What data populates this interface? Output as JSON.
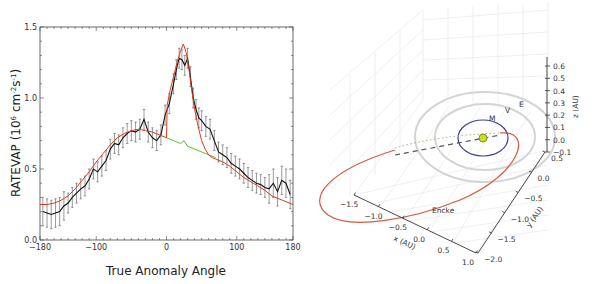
{
  "chart_data": [
    {
      "type": "line",
      "title": "",
      "xlabel": "True Anomaly Angle",
      "ylabel": "RATEVAP (10^6 cm^-2 s^-1)",
      "ylabel_parts": {
        "main": "RATEVAP (10",
        "sup1": "6",
        "mid": " cm",
        "sup2": "-2",
        "mid2": "s",
        "sup3": "-1",
        "end": ")"
      },
      "xlim": [
        -180,
        180
      ],
      "ylim": [
        0.0,
        1.5
      ],
      "xticks": [
        "-180",
        "-100",
        "0",
        "100",
        "180"
      ],
      "xtick_values": [
        -180,
        -100,
        0,
        100,
        180
      ],
      "yticks": [
        "0.0",
        "0.5",
        "1.0",
        "1.5"
      ],
      "ytick_values": [
        0.0,
        0.5,
        1.0,
        1.5
      ],
      "grid": false,
      "series": [
        {
          "name": "observed",
          "color": "#111111",
          "error_bars": true,
          "x": [
            -176,
            -170,
            -164,
            -158,
            -152,
            -146,
            -140,
            -134,
            -128,
            -122,
            -116,
            -110,
            -104,
            -98,
            -92,
            -86,
            -80,
            -74,
            -68,
            -62,
            -56,
            -50,
            -44,
            -38,
            -32,
            -26,
            -20,
            -14,
            -8,
            -2,
            4,
            10,
            14,
            18,
            22,
            26,
            30,
            34,
            38,
            42,
            46,
            50,
            56,
            62,
            68,
            74,
            80,
            86,
            92,
            98,
            104,
            110,
            116,
            122,
            128,
            134,
            140,
            146,
            152,
            158,
            164,
            170,
            176
          ],
          "y": [
            0.2,
            0.19,
            0.18,
            0.19,
            0.2,
            0.24,
            0.26,
            0.3,
            0.33,
            0.36,
            0.38,
            0.43,
            0.5,
            0.48,
            0.52,
            0.56,
            0.64,
            0.68,
            0.67,
            0.72,
            0.75,
            0.77,
            0.76,
            0.78,
            0.85,
            0.76,
            0.72,
            0.7,
            0.74,
            0.88,
            0.96,
            1.1,
            1.2,
            1.28,
            1.27,
            1.23,
            1.28,
            1.15,
            1.0,
            0.92,
            0.86,
            0.84,
            0.8,
            0.78,
            0.7,
            0.62,
            0.6,
            0.58,
            0.54,
            0.52,
            0.5,
            0.47,
            0.44,
            0.42,
            0.4,
            0.39,
            0.37,
            0.36,
            0.4,
            0.34,
            0.42,
            0.4,
            0.32
          ],
          "err": 0.07
        },
        {
          "name": "model",
          "color": "#e03a1e",
          "x": [
            -180,
            -170,
            -160,
            -150,
            -140,
            -130,
            -120,
            -110,
            -100,
            -90,
            -80,
            -70,
            -60,
            -50,
            -40,
            -30,
            -20,
            -10,
            0,
            1,
            5,
            10,
            15,
            20,
            24,
            28,
            32,
            36,
            40,
            45,
            50,
            55,
            60,
            65,
            70,
            80,
            90,
            100,
            110,
            120,
            130,
            140,
            150,
            160,
            170,
            180
          ],
          "y": [
            0.25,
            0.25,
            0.26,
            0.28,
            0.31,
            0.36,
            0.42,
            0.48,
            0.55,
            0.61,
            0.67,
            0.72,
            0.75,
            0.77,
            0.78,
            0.77,
            0.76,
            0.74,
            0.72,
            0.95,
            1.05,
            1.15,
            1.25,
            1.33,
            1.38,
            1.32,
            1.2,
            1.05,
            0.92,
            0.8,
            0.7,
            0.64,
            0.6,
            0.58,
            0.57,
            0.55,
            0.52,
            0.48,
            0.44,
            0.41,
            0.38,
            0.35,
            0.31,
            0.29,
            0.27,
            0.25
          ]
        },
        {
          "name": "baseline",
          "color": "#66bb33",
          "x": [
            0,
            10,
            20,
            25,
            30,
            40,
            50,
            60,
            70
          ],
          "y": [
            0.72,
            0.7,
            0.68,
            0.7,
            0.66,
            0.64,
            0.62,
            0.6,
            0.58
          ]
        }
      ]
    },
    {
      "type": "scatter",
      "subtype": "3d-orbit-plot",
      "title": "",
      "xlabel": "x (AU)",
      "ylabel": "y (AU)",
      "zlabel": "z (AU)",
      "xticks": [
        "-1.5",
        "-1.0",
        "-0.5",
        "0.0",
        "0.5",
        "1.0"
      ],
      "yticks": [
        "0.5",
        "0.0",
        "-0.5",
        "-1.0",
        "-1.5",
        "-2.0"
      ],
      "zticks": [
        "0.6",
        "0.5",
        "0.4",
        "0.3",
        "0.2",
        "0.1",
        "0.0",
        "-0.1"
      ],
      "xlim": [
        -1.5,
        1.0
      ],
      "ylim": [
        -2.0,
        0.5
      ],
      "zlim": [
        -0.1,
        0.6
      ],
      "grid": true,
      "orbits": [
        {
          "name": "Encke",
          "label": "Encke",
          "color": "#d9593c"
        },
        {
          "name": "Earth",
          "label": "E",
          "color": "#cccccc"
        },
        {
          "name": "Venus",
          "label": "V",
          "color": "#cccccc"
        },
        {
          "name": "Mercury",
          "label": "M",
          "color": "#3b3f8f"
        }
      ],
      "sun": {
        "color": "#c8e020"
      }
    }
  ]
}
